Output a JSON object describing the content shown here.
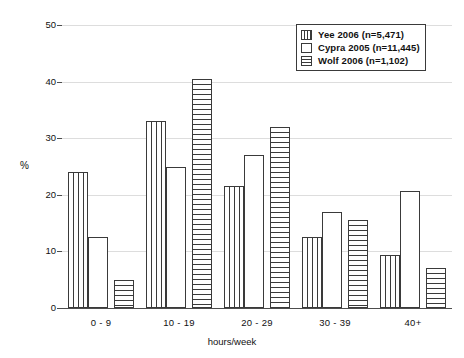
{
  "chart_data": {
    "type": "bar",
    "title": "",
    "xlabel": "hours/week",
    "ylabel": "%",
    "categories": [
      "0 - 9",
      "10 - 19",
      "20 - 29",
      "30 - 39",
      "40+"
    ],
    "ylim": [
      0,
      50
    ],
    "yticks": [
      0,
      10,
      20,
      30,
      40,
      50
    ],
    "grid": true,
    "legend_position": "top-right",
    "series": [
      {
        "name": "Yee 2006 (n=5,471)",
        "pattern": "vertical-stripes",
        "values": [
          24,
          33,
          21.5,
          12.5,
          9.3
        ]
      },
      {
        "name": "Cypra 2005 (n=11,445)",
        "pattern": "plain-white",
        "values": [
          12.5,
          25,
          27,
          17,
          20.7
        ]
      },
      {
        "name": "Wolf 2006 (n=1,102)",
        "pattern": "horizontal-stripes",
        "values": [
          5,
          40.5,
          32,
          15.5,
          7
        ]
      }
    ]
  },
  "axes": {
    "y_title": "%",
    "x_title": "hours/week",
    "y_tick_labels": [
      "0",
      "10",
      "20",
      "30",
      "40",
      "50"
    ],
    "x_tick_labels": [
      "0 - 9",
      "10 - 19",
      "20 - 29",
      "30 - 39",
      "40+"
    ]
  },
  "legend": {
    "entries": [
      {
        "label": "Yee 2006 (n=5,471)"
      },
      {
        "label": "Cypra 2005 (n=11,445)"
      },
      {
        "label": "Wolf 2006 (n=1,102)"
      }
    ]
  },
  "colors": {
    "bar_outline": "#3a3a3a",
    "bar_fill": "#ffffff",
    "gridline": "#dddddd",
    "axis": "#4d4d4d",
    "text": "#111111"
  }
}
